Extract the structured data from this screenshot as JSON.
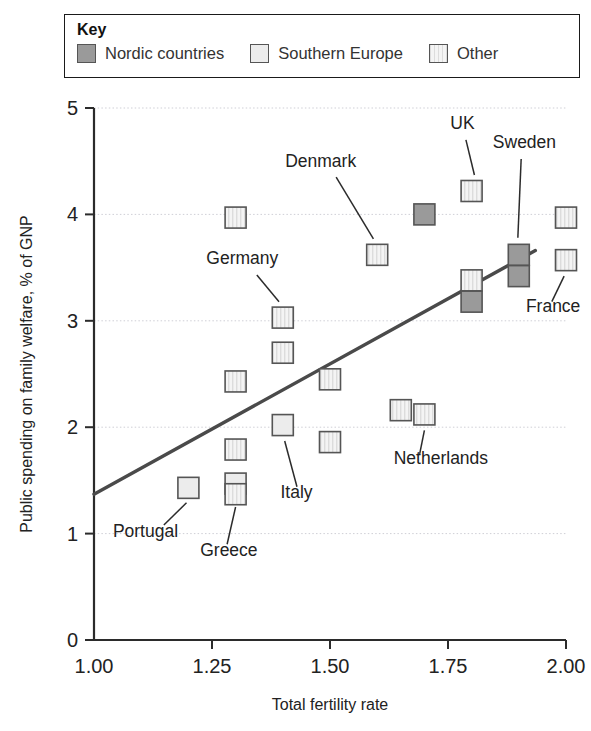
{
  "legend": {
    "title": "Key",
    "items": [
      {
        "label": "Nordic countries",
        "style": "nordic",
        "color": "#9a9a9a"
      },
      {
        "label": "Southern Europe",
        "style": "south",
        "color": "#ececec"
      },
      {
        "label": "Other",
        "style": "other",
        "color": "#efefef"
      }
    ]
  },
  "chart_data": {
    "type": "scatter",
    "title": "",
    "xlabel": "Total fertility rate",
    "ylabel": "Public spending on family welfare, % of GNP",
    "xlim": [
      1.0,
      2.0
    ],
    "ylim": [
      0,
      5
    ],
    "xticks": [
      "1.00",
      "1.25",
      "1.50",
      "1.75",
      "2.00"
    ],
    "xtick_values": [
      1.0,
      1.25,
      1.5,
      1.75,
      2.0
    ],
    "yticks": [
      "0",
      "1",
      "2",
      "3",
      "4",
      "5"
    ],
    "ytick_values": [
      0,
      1,
      2,
      3,
      4,
      5
    ],
    "grid": "horizontal",
    "legend_position": "top",
    "points": [
      {
        "x": 1.2,
        "y": 1.43,
        "style": "south",
        "label": "Portugal"
      },
      {
        "x": 1.3,
        "y": 1.47,
        "style": "south",
        "label": ""
      },
      {
        "x": 1.3,
        "y": 1.37,
        "style": "other",
        "label": "Greece"
      },
      {
        "x": 1.3,
        "y": 1.79,
        "style": "other",
        "label": ""
      },
      {
        "x": 1.3,
        "y": 2.43,
        "style": "other",
        "label": ""
      },
      {
        "x": 1.3,
        "y": 3.97,
        "style": "other",
        "label": ""
      },
      {
        "x": 1.4,
        "y": 2.02,
        "style": "south",
        "label": "Italy"
      },
      {
        "x": 1.4,
        "y": 2.7,
        "style": "other",
        "label": ""
      },
      {
        "x": 1.4,
        "y": 3.03,
        "style": "other",
        "label": "Germany"
      },
      {
        "x": 1.5,
        "y": 1.86,
        "style": "other",
        "label": ""
      },
      {
        "x": 1.5,
        "y": 2.45,
        "style": "other",
        "label": ""
      },
      {
        "x": 1.6,
        "y": 3.62,
        "style": "other",
        "label": "Denmark"
      },
      {
        "x": 1.65,
        "y": 2.16,
        "style": "other",
        "label": ""
      },
      {
        "x": 1.7,
        "y": 2.12,
        "style": "other",
        "label": "Netherlands"
      },
      {
        "x": 1.7,
        "y": 4.0,
        "style": "nordic",
        "label": ""
      },
      {
        "x": 1.8,
        "y": 4.22,
        "style": "other",
        "label": "UK"
      },
      {
        "x": 1.8,
        "y": 3.38,
        "style": "other",
        "label": ""
      },
      {
        "x": 1.8,
        "y": 3.18,
        "style": "nordic",
        "label": ""
      },
      {
        "x": 1.9,
        "y": 3.62,
        "style": "nordic",
        "label": "Sweden"
      },
      {
        "x": 1.9,
        "y": 3.42,
        "style": "nordic",
        "label": ""
      },
      {
        "x": 2.0,
        "y": 3.97,
        "style": "other",
        "label": ""
      },
      {
        "x": 2.0,
        "y": 3.57,
        "style": "other",
        "label": "France"
      }
    ],
    "trendline": {
      "x0": 1.0,
      "y0": 1.37,
      "x1": 1.935,
      "y1": 3.66
    },
    "annotations": [
      {
        "text": "Denmark",
        "tx": 1.405,
        "ty": 4.45,
        "anchor": "start",
        "lx0": 1.513,
        "ly0": 4.35,
        "lx1": 1.592,
        "ly1": 3.77
      },
      {
        "text": "UK",
        "tx": 1.755,
        "ty": 4.8,
        "anchor": "start",
        "lx0": 1.788,
        "ly0": 4.7,
        "lx1": 1.806,
        "ly1": 4.37
      },
      {
        "text": "Sweden",
        "tx": 1.845,
        "ty": 4.62,
        "anchor": "start",
        "lx0": 1.905,
        "ly0": 4.52,
        "lx1": 1.898,
        "ly1": 3.78
      },
      {
        "text": "Germany",
        "tx": 1.238,
        "ty": 3.53,
        "anchor": "start",
        "lx0": 1.345,
        "ly0": 3.43,
        "lx1": 1.392,
        "ly1": 3.18
      },
      {
        "text": "France",
        "tx": 1.915,
        "ty": 3.08,
        "anchor": "start",
        "lx0": 1.97,
        "ly0": 3.18,
        "lx1": 1.996,
        "ly1": 3.42
      },
      {
        "text": "Italy",
        "tx": 1.395,
        "ty": 1.33,
        "anchor": "start",
        "lx0": 1.43,
        "ly0": 1.44,
        "lx1": 1.404,
        "ly1": 1.87
      },
      {
        "text": "Netherlands",
        "tx": 1.635,
        "ty": 1.65,
        "anchor": "start",
        "lx0": 1.69,
        "ly0": 1.75,
        "lx1": 1.7,
        "ly1": 1.97
      },
      {
        "text": "Portugal",
        "tx": 1.04,
        "ty": 0.97,
        "anchor": "start",
        "lx0": 1.148,
        "ly0": 1.08,
        "lx1": 1.196,
        "ly1": 1.29
      },
      {
        "text": "Greece",
        "tx": 1.225,
        "ty": 0.79,
        "anchor": "start",
        "lx0": 1.282,
        "ly0": 0.9,
        "lx1": 1.3,
        "ly1": 1.25
      }
    ]
  }
}
